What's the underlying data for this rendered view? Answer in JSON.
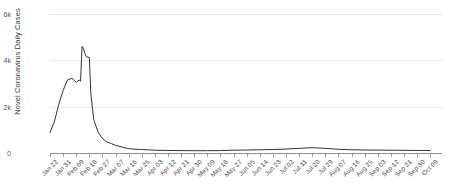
{
  "chart_data": {
    "type": "line",
    "title": "",
    "xlabel": "",
    "ylabel": "Novel Coronavirus Daily Cases",
    "ylim": [
      0,
      6000
    ],
    "ytick_labels": [
      "0",
      "2k",
      "4k",
      "6k"
    ],
    "ytick_values": [
      0,
      2000,
      4000,
      6000
    ],
    "grid": true,
    "legend": "none",
    "line_color": "#333333",
    "gridline_color": "#e8e8e8",
    "axis_color": "#8c8c8c",
    "xtick_labels": [
      "Jan 22",
      "Jan 31",
      "Feb 09",
      "Feb 18",
      "Feb 27",
      "Mar 07",
      "Mar 16",
      "Mar 25",
      "Apr 03",
      "Apr 12",
      "Apr 21",
      "Apr 30",
      "May 09",
      "May 18",
      "May 27",
      "Jun 05",
      "Jun 14",
      "Jun 23",
      "Jul 02",
      "Jul 11",
      "Jul 20",
      "Jul 29",
      "Aug 07",
      "Aug 16",
      "Aug 25",
      "Sep 03",
      "Sep 12",
      "Sep 21",
      "Sep 30",
      "Oct 09"
    ],
    "x": [
      "Jan 22",
      "Jan 25",
      "Jan 28",
      "Jan 31",
      "Feb 03",
      "Feb 06",
      "Feb 09",
      "Feb 11",
      "Feb 12",
      "Feb 13",
      "Feb 14",
      "Feb 15",
      "Feb 16",
      "Feb 18",
      "Feb 19",
      "Feb 21",
      "Feb 24",
      "Feb 27",
      "Mar 01",
      "Mar 04",
      "Mar 07",
      "Mar 10",
      "Mar 13",
      "Mar 16",
      "Mar 19",
      "Mar 22",
      "Mar 25",
      "Mar 28",
      "Apr 03",
      "Apr 12",
      "Apr 21",
      "Apr 30",
      "May 09",
      "May 18",
      "May 27",
      "Jun 05",
      "Jun 14",
      "Jun 23",
      "Jul 02",
      "Jul 11",
      "Jul 20",
      "Jul 29",
      "Aug 07",
      "Aug 16",
      "Aug 25",
      "Sep 03",
      "Sep 12",
      "Sep 21",
      "Sep 30",
      "Oct 09"
    ],
    "values": [
      880,
      1350,
      2100,
      2700,
      3150,
      3230,
      3050,
      3150,
      3100,
      4600,
      4500,
      4300,
      4150,
      4120,
      2600,
      1450,
      900,
      620,
      480,
      410,
      330,
      280,
      230,
      190,
      170,
      160,
      150,
      140,
      120,
      110,
      105,
      100,
      100,
      105,
      120,
      130,
      140,
      150,
      170,
      200,
      230,
      200,
      160,
      140,
      130,
      125,
      120,
      115,
      110,
      105
    ],
    "series_name": "Novel Coronavirus Daily Cases",
    "annotations": []
  }
}
